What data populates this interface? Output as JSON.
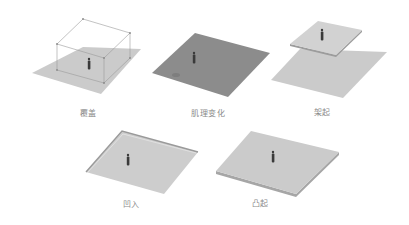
{
  "figure": {
    "panels": [
      {
        "id": "cover",
        "label": "覆盖",
        "label_x": 88,
        "label_y": 107
      },
      {
        "id": "texture-change",
        "label": "肌理变化",
        "label_x": 208,
        "label_y": 107
      },
      {
        "id": "elevated",
        "label": "架起",
        "label_x": 322,
        "label_y": 106
      },
      {
        "id": "recessed",
        "label": "凹入",
        "label_x": 131,
        "label_y": 198
      },
      {
        "id": "raised",
        "label": "凸起",
        "label_x": 260,
        "label_y": 197
      }
    ],
    "colors": {
      "plane": "#c8c8c8",
      "plane_dark": "#8c8c8c",
      "edge": "#a0a0a0",
      "wire": "#9a9a9a",
      "figure": "#3a3a3a",
      "label": "#8a8a8a"
    }
  }
}
